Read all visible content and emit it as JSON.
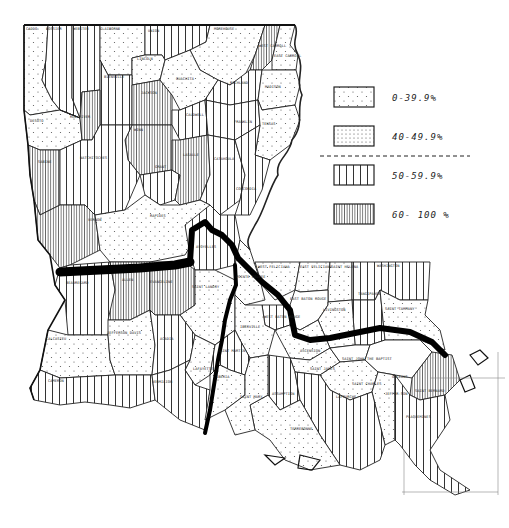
{
  "map": {
    "subject": "Louisiana parishes",
    "legend": {
      "items": [
        {
          "label": "0-39.9%",
          "pattern": "sparse-dots"
        },
        {
          "label": "40-49.9%",
          "pattern": "dense-dots"
        },
        {
          "label": "50-59.9%",
          "pattern": "wide-vertical-lines"
        },
        {
          "label": "60- 100 %",
          "pattern": "dense-vertical-lines"
        }
      ],
      "divider": "dashed"
    },
    "parish_labels": {
      "caddo": "CADDO",
      "bossier": "BOSSIER",
      "webster": "WEBSTER",
      "claiborne": "CLAIBORNE",
      "union": "UNION",
      "morehouse": "MOREHOUSE",
      "west_carroll": "WEST CARROLL",
      "east_carroll": "EAST CARROLL",
      "lincoln": "LINCOLN",
      "bienville": "BIENVILLE",
      "ouachita": "OUACHITA",
      "richland": "RICHLAND",
      "madison": "MADISON",
      "jackson": "JACKSON",
      "desoto": "DESOTO",
      "red_river": "RED RIVER",
      "caldwell": "CALDWELL",
      "franklin": "FRANKLIN",
      "tensas": "TENSAS",
      "winn": "WINN",
      "sabine": "SABINE",
      "natchitoches": "NATCHITOCHES",
      "grant": "GRANT",
      "lasalle": "LASALLE",
      "catahoula": "CATAHOULA",
      "concordia": "CONCORDIA",
      "vernon": "VERNON",
      "rapides": "RAPIDES",
      "avoyelles": "AVOYELLES",
      "beauregard": "BEAUREGARD",
      "allen": "ALLEN",
      "evangeline": "EVANGELINE",
      "saint_landry": "SAINT LANDRY",
      "pointe_coupee": "POINTE COUPEE",
      "west_feliciana": "WEST FELICIANA",
      "east_feliciana": "EAST FELICIANA",
      "saint_helena": "SAINT HELENA",
      "washington": "WASHINGTON",
      "tangipahoa": "TANGIPAHOA",
      "saint_tammany": "SAINT TAMMANY",
      "east_baton_rouge": "EAST BATON ROUGE",
      "livingston": "LIVINGSTON",
      "west_baton_rouge": "WEST BATON ROUGE",
      "iberville": "IBERVILLE",
      "ascension": "ASCENSION",
      "saint_james": "SAINT JAMES",
      "saint_john": "SAINT JOHN THE BAPTIST",
      "saint_charles": "SAINT CHARLES",
      "orleans": "ORLEANS",
      "jefferson": "JEFFER-SON",
      "saint_bernard": "SAINT BERNARD",
      "plaquemines": "PLAQUEMINES",
      "lafourche": "LAFOURCHE",
      "terrebonne": "TERREBONNE",
      "assumption": "ASSUMPTION",
      "saint_martin": "SAINT MARTIN",
      "saint_mary": "SAINT MARY",
      "iberia": "IBERIA",
      "lafayette": "LAFAYETTE",
      "acadia": "ACADIA",
      "calcasieu": "CALCASIEU",
      "jefferson_davis": "JEFFERSON DAVIS",
      "cameron": "CAMERON",
      "vermilion": "VERMILION"
    }
  }
}
